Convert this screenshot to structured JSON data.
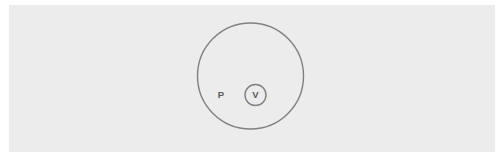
{
  "canvas": {
    "width": 504,
    "height": 163,
    "background_color": "#ffffff"
  },
  "panel": {
    "background_color": "#ececec",
    "x": 9,
    "y": 5,
    "width": 486,
    "height": 147
  },
  "diagram": {
    "type": "set-containment-diagram",
    "stroke_color": "#808080",
    "label_color": "#5a5a5a",
    "shapes": [
      {
        "name": "outer-set-circle",
        "label": "P",
        "cx": 250.5,
        "cy": 76,
        "r": 53,
        "label_x": 221,
        "label_y": 95.5
      },
      {
        "name": "inner-set-circle",
        "label": "V",
        "cx": 255.5,
        "cy": 95,
        "r": 10.5,
        "label_x": 255.5,
        "label_y": 95.5
      }
    ]
  }
}
